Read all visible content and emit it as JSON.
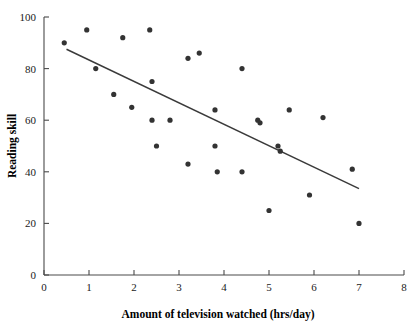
{
  "chart_data": {
    "type": "scatter",
    "title": "",
    "xlabel": "Amount of television watched (hrs/day)",
    "ylabel": "Reading skill",
    "xlim": [
      0,
      8
    ],
    "ylim": [
      0,
      100
    ],
    "xticks": [
      0,
      1,
      2,
      3,
      4,
      5,
      6,
      7,
      8
    ],
    "yticks": [
      0,
      20,
      40,
      60,
      80,
      100
    ],
    "xtick_labels": [
      "0",
      "1",
      "2",
      "3",
      "4",
      "5",
      "6",
      "7",
      "8"
    ],
    "ytick_labels": [
      "0",
      "20",
      "40",
      "60",
      "80",
      "100"
    ],
    "grid": false,
    "legend": false,
    "marker": "filled-circle",
    "marker_color": "#333333",
    "point_count": 29,
    "points": [
      {
        "x": 0.45,
        "y": 90
      },
      {
        "x": 0.95,
        "y": 95
      },
      {
        "x": 1.15,
        "y": 80
      },
      {
        "x": 1.55,
        "y": 70
      },
      {
        "x": 1.75,
        "y": 92
      },
      {
        "x": 1.95,
        "y": 65
      },
      {
        "x": 2.35,
        "y": 95
      },
      {
        "x": 2.4,
        "y": 75
      },
      {
        "x": 2.4,
        "y": 60
      },
      {
        "x": 2.5,
        "y": 50
      },
      {
        "x": 2.8,
        "y": 60
      },
      {
        "x": 3.2,
        "y": 84
      },
      {
        "x": 3.2,
        "y": 43
      },
      {
        "x": 3.45,
        "y": 86
      },
      {
        "x": 3.8,
        "y": 64
      },
      {
        "x": 3.8,
        "y": 50
      },
      {
        "x": 3.85,
        "y": 40
      },
      {
        "x": 4.4,
        "y": 80
      },
      {
        "x": 4.4,
        "y": 40
      },
      {
        "x": 4.75,
        "y": 60
      },
      {
        "x": 4.8,
        "y": 59
      },
      {
        "x": 5.0,
        "y": 25
      },
      {
        "x": 5.2,
        "y": 50
      },
      {
        "x": 5.25,
        "y": 48
      },
      {
        "x": 5.45,
        "y": 64
      },
      {
        "x": 5.9,
        "y": 31
      },
      {
        "x": 6.2,
        "y": 61
      },
      {
        "x": 6.85,
        "y": 41
      },
      {
        "x": 7.0,
        "y": 20
      }
    ],
    "trend_line": {
      "label": "regression-line",
      "x_start": 0.5,
      "y_start": 87.5,
      "x_end": 7.0,
      "y_end": 33.5,
      "color": "#3a3a3a"
    }
  },
  "axes": {
    "x_axis_name": "x-axis",
    "y_axis_name": "y-axis"
  }
}
